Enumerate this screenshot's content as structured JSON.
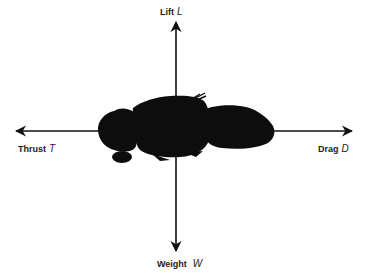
{
  "diagram": {
    "colors": {
      "background": "#ffffff",
      "ink": "#111111"
    },
    "forces": [
      {
        "key": "lift",
        "name": "Lift",
        "symbol": "L",
        "direction": "up"
      },
      {
        "key": "weight",
        "name": "Weight",
        "symbol": "W",
        "direction": "down"
      },
      {
        "key": "thrust",
        "name": "Thrust",
        "symbol": "T",
        "direction": "left"
      },
      {
        "key": "drag",
        "name": "Drag",
        "symbol": "D",
        "direction": "right"
      }
    ]
  }
}
